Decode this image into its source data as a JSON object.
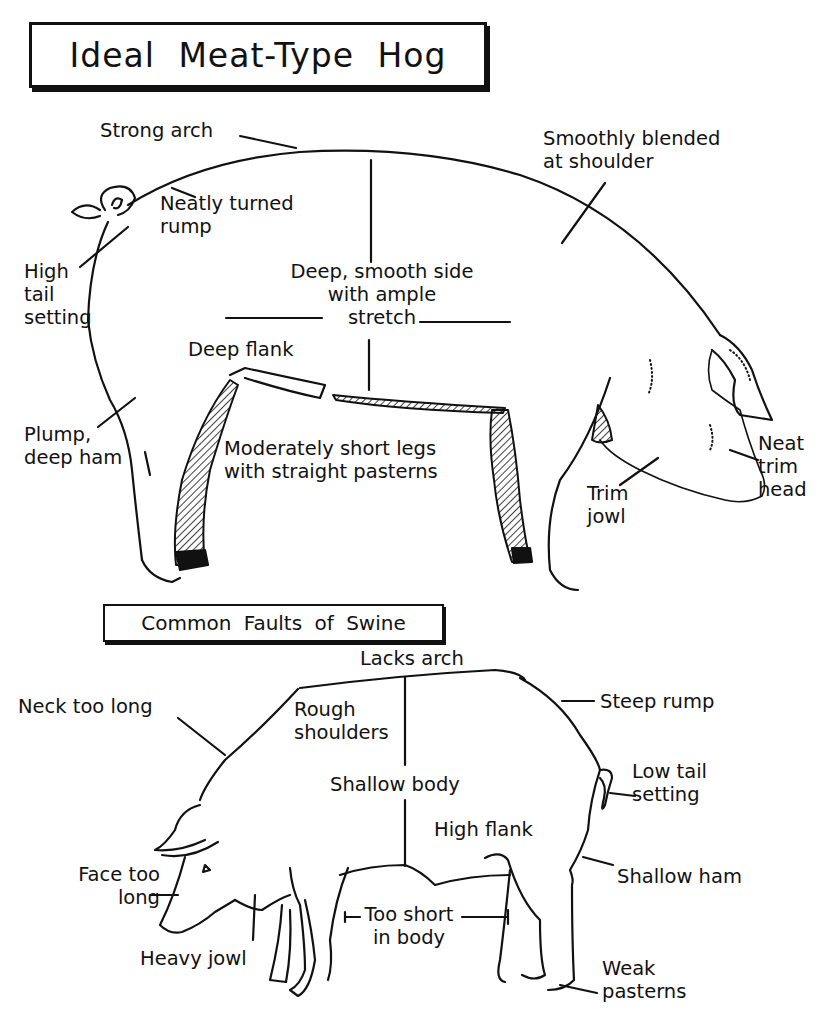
{
  "title": "Ideal Meat-Type Hog",
  "ideal_hog": {
    "labels": [
      {
        "id": "strong-arch",
        "text": "Strong arch"
      },
      {
        "id": "neatly-turned-rump",
        "text": "Neatly turned\nrump"
      },
      {
        "id": "smoothly-blended",
        "text": "Smoothly blended\nat shoulder"
      },
      {
        "id": "high-tail-setting",
        "text": "High\ntail\nsetting"
      },
      {
        "id": "deep-smooth-side",
        "text": "Deep, smooth side\nwith ample\nstretch"
      },
      {
        "id": "deep-flank",
        "text": "Deep flank"
      },
      {
        "id": "plump-deep-ham",
        "text": "Plump,\ndeep ham"
      },
      {
        "id": "moderately-short-legs",
        "text": "Moderately short legs\nwith straight pasterns"
      },
      {
        "id": "neat-trim-head",
        "text": "Neat\ntrim\nhead"
      },
      {
        "id": "trim-jowl",
        "text": "Trim\njowl"
      }
    ]
  },
  "faults_title": "Common Faults of Swine",
  "faults_hog": {
    "labels": [
      {
        "id": "lacks-arch",
        "text": "Lacks arch"
      },
      {
        "id": "neck-too-long",
        "text": "Neck too long"
      },
      {
        "id": "rough-shoulders",
        "text": "Rough\nshoulders"
      },
      {
        "id": "steep-rump",
        "text": "Steep rump"
      },
      {
        "id": "shallow-body",
        "text": "Shallow body"
      },
      {
        "id": "low-tail-setting",
        "text": "Low tail\nsetting"
      },
      {
        "id": "high-flank",
        "text": "High flank"
      },
      {
        "id": "face-too-long",
        "text": "Face too\nlong"
      },
      {
        "id": "shallow-ham",
        "text": "Shallow ham"
      },
      {
        "id": "too-short-in-body",
        "text": "Too short\nin body"
      },
      {
        "id": "heavy-jowl",
        "text": "Heavy jowl"
      },
      {
        "id": "weak-pasterns",
        "text": "Weak\npasterns"
      }
    ]
  },
  "colors": {
    "ink": "#111111",
    "paper": "#ffffff"
  }
}
